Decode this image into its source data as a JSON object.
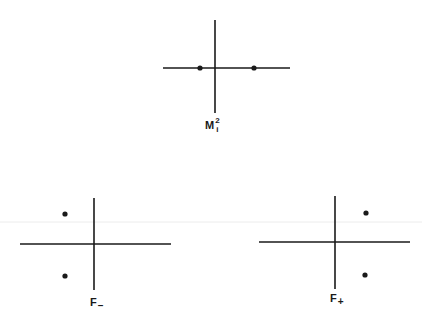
{
  "colors": {
    "line": "#1a1a1a",
    "dot": "#1a1a1a",
    "background": "#ffffff",
    "faint_rule": "#ececec"
  },
  "diagrams": [
    {
      "id": "m2",
      "label": {
        "base": "M",
        "sup": "2",
        "sub": "i"
      },
      "axes": {
        "cx": 215,
        "cy": 68,
        "h": [
          163,
          290
        ],
        "v": [
          20,
          113
        ]
      },
      "points": [
        {
          "x": 200,
          "y": 68
        },
        {
          "x": 254,
          "y": 68
        }
      ]
    },
    {
      "id": "f-minus",
      "label": {
        "base": "F",
        "sub": "–"
      },
      "axes": {
        "cx": 94,
        "cy": 244,
        "h": [
          20,
          171
        ],
        "v": [
          198,
          290
        ]
      },
      "points": [
        {
          "x": 65,
          "y": 214
        },
        {
          "x": 65,
          "y": 276
        }
      ]
    },
    {
      "id": "f-plus",
      "label": {
        "base": "F",
        "sub": "+"
      },
      "axes": {
        "cx": 335,
        "cy": 242,
        "h": [
          259,
          410
        ],
        "v": [
          196,
          289
        ]
      },
      "points": [
        {
          "x": 366,
          "y": 213
        },
        {
          "x": 365,
          "y": 275
        }
      ]
    }
  ]
}
